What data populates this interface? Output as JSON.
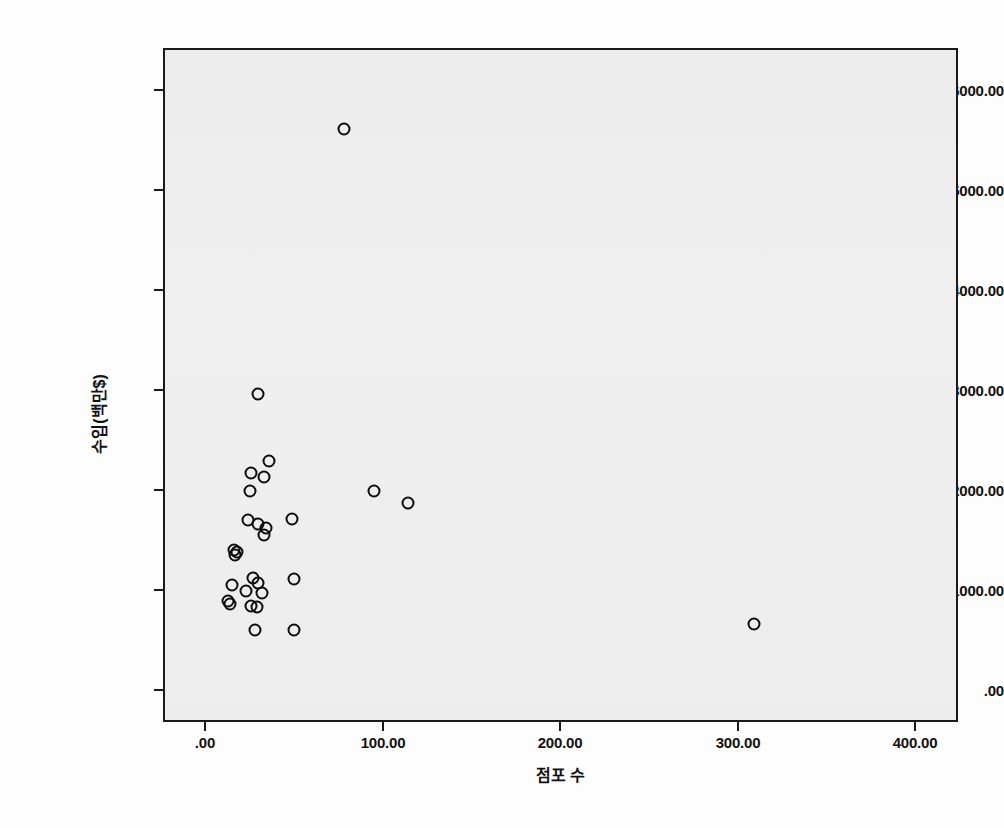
{
  "axes": {
    "y_title": "수입(백만$)",
    "x_title": "점포 수",
    "y_ticks": [
      "6000.00",
      "5000.00",
      "4000.00",
      "3000.00",
      "2000.00",
      "1000.00",
      ".00"
    ],
    "x_ticks": [
      ".00",
      "100.00",
      "200.00",
      "300.00",
      "400.00"
    ]
  },
  "style": {
    "plot_background": "#ededed",
    "frame_color": "#1a1a1a",
    "marker_color": "#0d0d0d",
    "page_background": "#fdfdfd"
  },
  "chart_data": {
    "type": "scatter",
    "title": "",
    "xlabel": "점포 수",
    "ylabel": "수입(백만$)",
    "xlim": [
      -22,
      423
    ],
    "ylim": [
      -420,
      6320
    ],
    "xticks": [
      0,
      100,
      200,
      300,
      400
    ],
    "yticks": [
      0,
      1000,
      2000,
      3000,
      4000,
      5000,
      6000
    ],
    "grid": false,
    "legend": "none",
    "marker": "open-circle",
    "points": [
      {
        "x": 77,
        "y": 5630
      },
      {
        "x": 29,
        "y": 2985
      },
      {
        "x": 35,
        "y": 2310
      },
      {
        "x": 25,
        "y": 2190
      },
      {
        "x": 32,
        "y": 2150
      },
      {
        "x": 24,
        "y": 2010
      },
      {
        "x": 94,
        "y": 2010
      },
      {
        "x": 113,
        "y": 1890
      },
      {
        "x": 48,
        "y": 1730
      },
      {
        "x": 23,
        "y": 1720
      },
      {
        "x": 29,
        "y": 1680
      },
      {
        "x": 33,
        "y": 1640
      },
      {
        "x": 32,
        "y": 1570
      },
      {
        "x": 15,
        "y": 1420
      },
      {
        "x": 17,
        "y": 1400
      },
      {
        "x": 16,
        "y": 1370
      },
      {
        "x": 49,
        "y": 1130
      },
      {
        "x": 26,
        "y": 1140
      },
      {
        "x": 29,
        "y": 1090
      },
      {
        "x": 14,
        "y": 1070
      },
      {
        "x": 22,
        "y": 1010
      },
      {
        "x": 31,
        "y": 990
      },
      {
        "x": 12,
        "y": 910
      },
      {
        "x": 13,
        "y": 880
      },
      {
        "x": 25,
        "y": 860
      },
      {
        "x": 28,
        "y": 855
      },
      {
        "x": 308,
        "y": 680
      },
      {
        "x": 27,
        "y": 620
      },
      {
        "x": 49,
        "y": 620
      }
    ]
  }
}
